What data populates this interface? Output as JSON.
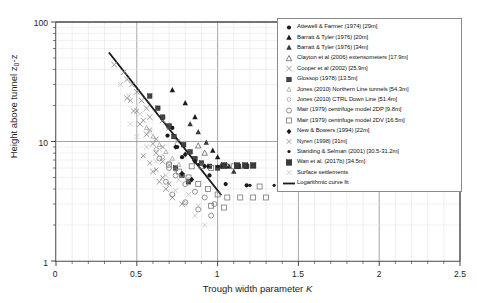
{
  "chart_data": {
    "type": "scatter",
    "title": "",
    "xlabel": "Trough width parameter K",
    "ylabel": "Height above tunnel z0-z",
    "xlim": [
      0,
      2.5
    ],
    "ylim": [
      1,
      100
    ],
    "yscale": "log",
    "xscale": "linear",
    "grid": true,
    "legend_position": "top-right",
    "xticks": [
      "0",
      "0.5",
      "1",
      "1.5",
      "2",
      "2.5"
    ],
    "xtick_values": [
      0,
      0.5,
      1,
      1.5,
      2,
      2.5
    ],
    "yticks": [
      "1",
      "10",
      "100"
    ],
    "ytick_values": [
      1,
      10,
      100
    ],
    "series": [
      {
        "name": "Attewell & Farmer (1974) [29m]",
        "marker": "filled-circle",
        "color": "#1a1a1a",
        "points": [
          [
            0.69,
            11.2
          ],
          [
            0.75,
            9.0
          ],
          [
            0.78,
            7.4
          ],
          [
            0.95,
            5.2
          ],
          [
            1.05,
            4.4
          ],
          [
            1.18,
            4.3
          ],
          [
            0.72,
            13.0
          ]
        ]
      },
      {
        "name": "Barratt & Tyler (1976) [20m]",
        "marker": "filled-triangle",
        "color": "#1a1a1a",
        "points": [
          [
            0.72,
            27.0
          ],
          [
            0.8,
            21.0
          ],
          [
            0.86,
            16.0
          ],
          [
            1.0,
            7.4
          ],
          [
            1.07,
            6.2
          ],
          [
            1.12,
            6.2
          ],
          [
            0.97,
            8.4
          ]
        ]
      },
      {
        "name": "Barratt & Tyler (1976) [34m]",
        "marker": "filled-triangle",
        "color": "#3a3a3a",
        "points": [
          [
            0.88,
            12.0
          ],
          [
            0.93,
            9.8
          ],
          [
            1.02,
            6.2
          ],
          [
            1.1,
            5.6
          ],
          [
            0.83,
            14.0
          ]
        ]
      },
      {
        "name": "Clayton et al (2006) extensometers [17.9m]",
        "marker": "open-triangle",
        "color": "#666666",
        "points": [
          [
            1.02,
            6.2
          ],
          [
            1.06,
            6.2
          ],
          [
            1.13,
            6.2
          ],
          [
            0.92,
            8.0
          ],
          [
            0.88,
            9.2
          ]
        ]
      },
      {
        "name": "Cooper et al (2002) [25.9m]",
        "marker": "cross-x",
        "color": "#8a8a8a",
        "points": [
          [
            0.36,
            44.0
          ],
          [
            0.42,
            38.0
          ],
          [
            0.44,
            33.0
          ],
          [
            0.47,
            30.0
          ],
          [
            0.5,
            26.0
          ],
          [
            0.53,
            22.0
          ],
          [
            0.56,
            19.0
          ],
          [
            0.58,
            16.0
          ],
          [
            0.44,
            23.0
          ],
          [
            0.48,
            18.0
          ],
          [
            0.52,
            14.0
          ],
          [
            0.56,
            11.5
          ],
          [
            0.6,
            9.6
          ],
          [
            0.62,
            8.0
          ],
          [
            0.66,
            6.8
          ],
          [
            0.6,
            5.6
          ],
          [
            0.64,
            4.6
          ],
          [
            0.68,
            4.0
          ],
          [
            0.72,
            3.4
          ],
          [
            0.7,
            13.0
          ],
          [
            0.66,
            15.0
          ],
          [
            0.75,
            10.0
          ],
          [
            1.5,
            5.0
          ],
          [
            0.78,
            3.0
          ]
        ]
      },
      {
        "name": "Glossop (1978) [13.5m]",
        "marker": "filled-square",
        "color": "#444444",
        "points": [
          [
            0.58,
            24.0
          ],
          [
            0.63,
            19.0
          ],
          [
            0.66,
            16.0
          ],
          [
            0.7,
            13.5
          ],
          [
            0.73,
            11.0
          ],
          [
            0.79,
            9.4
          ],
          [
            0.83,
            8.2
          ],
          [
            0.86,
            7.2
          ],
          [
            0.9,
            6.6
          ],
          [
            0.74,
            6.0
          ],
          [
            0.78,
            5.2
          ],
          [
            0.82,
            4.6
          ],
          [
            0.95,
            6.2
          ],
          [
            1.0,
            6.0
          ],
          [
            1.13,
            6.2
          ],
          [
            1.18,
            6.2
          ]
        ]
      },
      {
        "name": "Jones (2010) Northern Line tunnels [54.3m]",
        "marker": "open-triangle-sm",
        "color": "#999999",
        "points": [
          [
            0.56,
            13.0
          ],
          [
            0.6,
            11.0
          ],
          [
            0.64,
            9.4
          ],
          [
            0.68,
            8.2
          ],
          [
            0.72,
            7.2
          ],
          [
            0.76,
            6.4
          ]
        ]
      },
      {
        "name": "Jones (2010) CTRL Down Line [51.4m]",
        "marker": "open-circle-sm",
        "color": "#999999",
        "points": [
          [
            0.62,
            8.6
          ],
          [
            0.66,
            7.4
          ],
          [
            0.7,
            6.6
          ],
          [
            0.74,
            5.8
          ],
          [
            0.78,
            5.2
          ],
          [
            0.82,
            4.8
          ]
        ]
      },
      {
        "name": "Mair (1979) centrifuge model 2DP [9.8m]",
        "marker": "open-circle",
        "color": "#777777",
        "points": [
          [
            0.64,
            7.2
          ],
          [
            0.7,
            6.0
          ],
          [
            0.74,
            5.2
          ],
          [
            0.8,
            4.4
          ],
          [
            0.86,
            3.8
          ],
          [
            0.92,
            3.4
          ],
          [
            0.98,
            3.0
          ],
          [
            0.72,
            3.6
          ],
          [
            0.8,
            3.1
          ],
          [
            0.88,
            2.7
          ],
          [
            0.96,
            2.4
          ],
          [
            0.68,
            4.6
          ]
        ]
      },
      {
        "name": "Mair (1979) centrifuge model 2DV [16.5m]",
        "marker": "open-square",
        "color": "#777777",
        "points": [
          [
            0.7,
            6.4
          ],
          [
            0.76,
            5.6
          ],
          [
            0.82,
            5.0
          ],
          [
            0.88,
            4.4
          ],
          [
            0.94,
            4.0
          ],
          [
            1.0,
            3.6
          ],
          [
            1.06,
            3.4
          ],
          [
            1.14,
            3.4
          ],
          [
            1.22,
            3.4
          ],
          [
            1.3,
            3.4
          ],
          [
            0.84,
            6.2
          ],
          [
            0.9,
            6.2
          ],
          [
            0.96,
            6.0
          ],
          [
            1.1,
            6.2
          ],
          [
            1.26,
            4.2
          ],
          [
            0.96,
            2.9
          ],
          [
            1.04,
            2.8
          ]
        ]
      },
      {
        "name": "New & Bowers (1994) [22m]",
        "marker": "filled-diamond",
        "color": "#1a1a1a",
        "points": [
          [
            0.74,
            9.0
          ],
          [
            0.8,
            7.8
          ],
          [
            0.86,
            6.8
          ],
          [
            0.92,
            6.2
          ],
          [
            0.78,
            5.4
          ],
          [
            0.84,
            4.8
          ]
        ]
      },
      {
        "name": "Nyren (1998) [31m]",
        "marker": "cross-x-sm",
        "color": "#8a8a8a",
        "points": [
          [
            0.46,
            22.0
          ],
          [
            0.5,
            18.0
          ],
          [
            0.54,
            15.0
          ],
          [
            0.58,
            12.5
          ],
          [
            0.62,
            10.5
          ],
          [
            0.66,
            9.0
          ],
          [
            0.54,
            7.6
          ],
          [
            0.58,
            6.6
          ],
          [
            0.62,
            5.8
          ],
          [
            0.66,
            5.0
          ],
          [
            0.7,
            4.4
          ]
        ]
      },
      {
        "name": "Standing & Selman (2001) [30.5-31.2m]",
        "marker": "filled-dot",
        "color": "#1a1a1a",
        "points": [
          [
            0.88,
            6.4
          ],
          [
            0.94,
            6.2
          ],
          [
            1.0,
            6.2
          ],
          [
            1.2,
            4.3
          ],
          [
            1.35,
            4.3
          ]
        ]
      },
      {
        "name": "Wan et al. (2017b) [34.5m]",
        "marker": "filled-square-lg",
        "color": "#3a3a3a",
        "points": [
          [
            1.12,
            6.3
          ],
          [
            1.17,
            6.3
          ],
          [
            1.22,
            6.3
          ],
          [
            1.04,
            6.3
          ]
        ]
      },
      {
        "name": "Surface settlements",
        "marker": "cross-x-faint",
        "color": "#bcbcbc",
        "points": [
          [
            0.4,
            30.0
          ],
          [
            0.45,
            24.0
          ],
          [
            0.52,
            17.0
          ],
          [
            0.58,
            12.0
          ],
          [
            0.64,
            8.6
          ],
          [
            0.7,
            6.4
          ],
          [
            0.76,
            4.8
          ],
          [
            0.82,
            3.6
          ],
          [
            0.56,
            9.0
          ],
          [
            0.62,
            6.8
          ],
          [
            0.68,
            5.2
          ],
          [
            0.74,
            3.9
          ],
          [
            0.8,
            3.0
          ],
          [
            0.86,
            2.4
          ],
          [
            0.92,
            2.0
          ],
          [
            0.5,
            11.0
          ],
          [
            0.46,
            14.0
          ],
          [
            0.88,
            2.9
          ]
        ]
      }
    ],
    "fit": {
      "name": "Logarithmic curve fit",
      "style": "solid-line",
      "color": "#1a1a1a",
      "endpoints": [
        [
          0.33,
          55.0
        ],
        [
          1.02,
          3.6
        ]
      ]
    }
  }
}
